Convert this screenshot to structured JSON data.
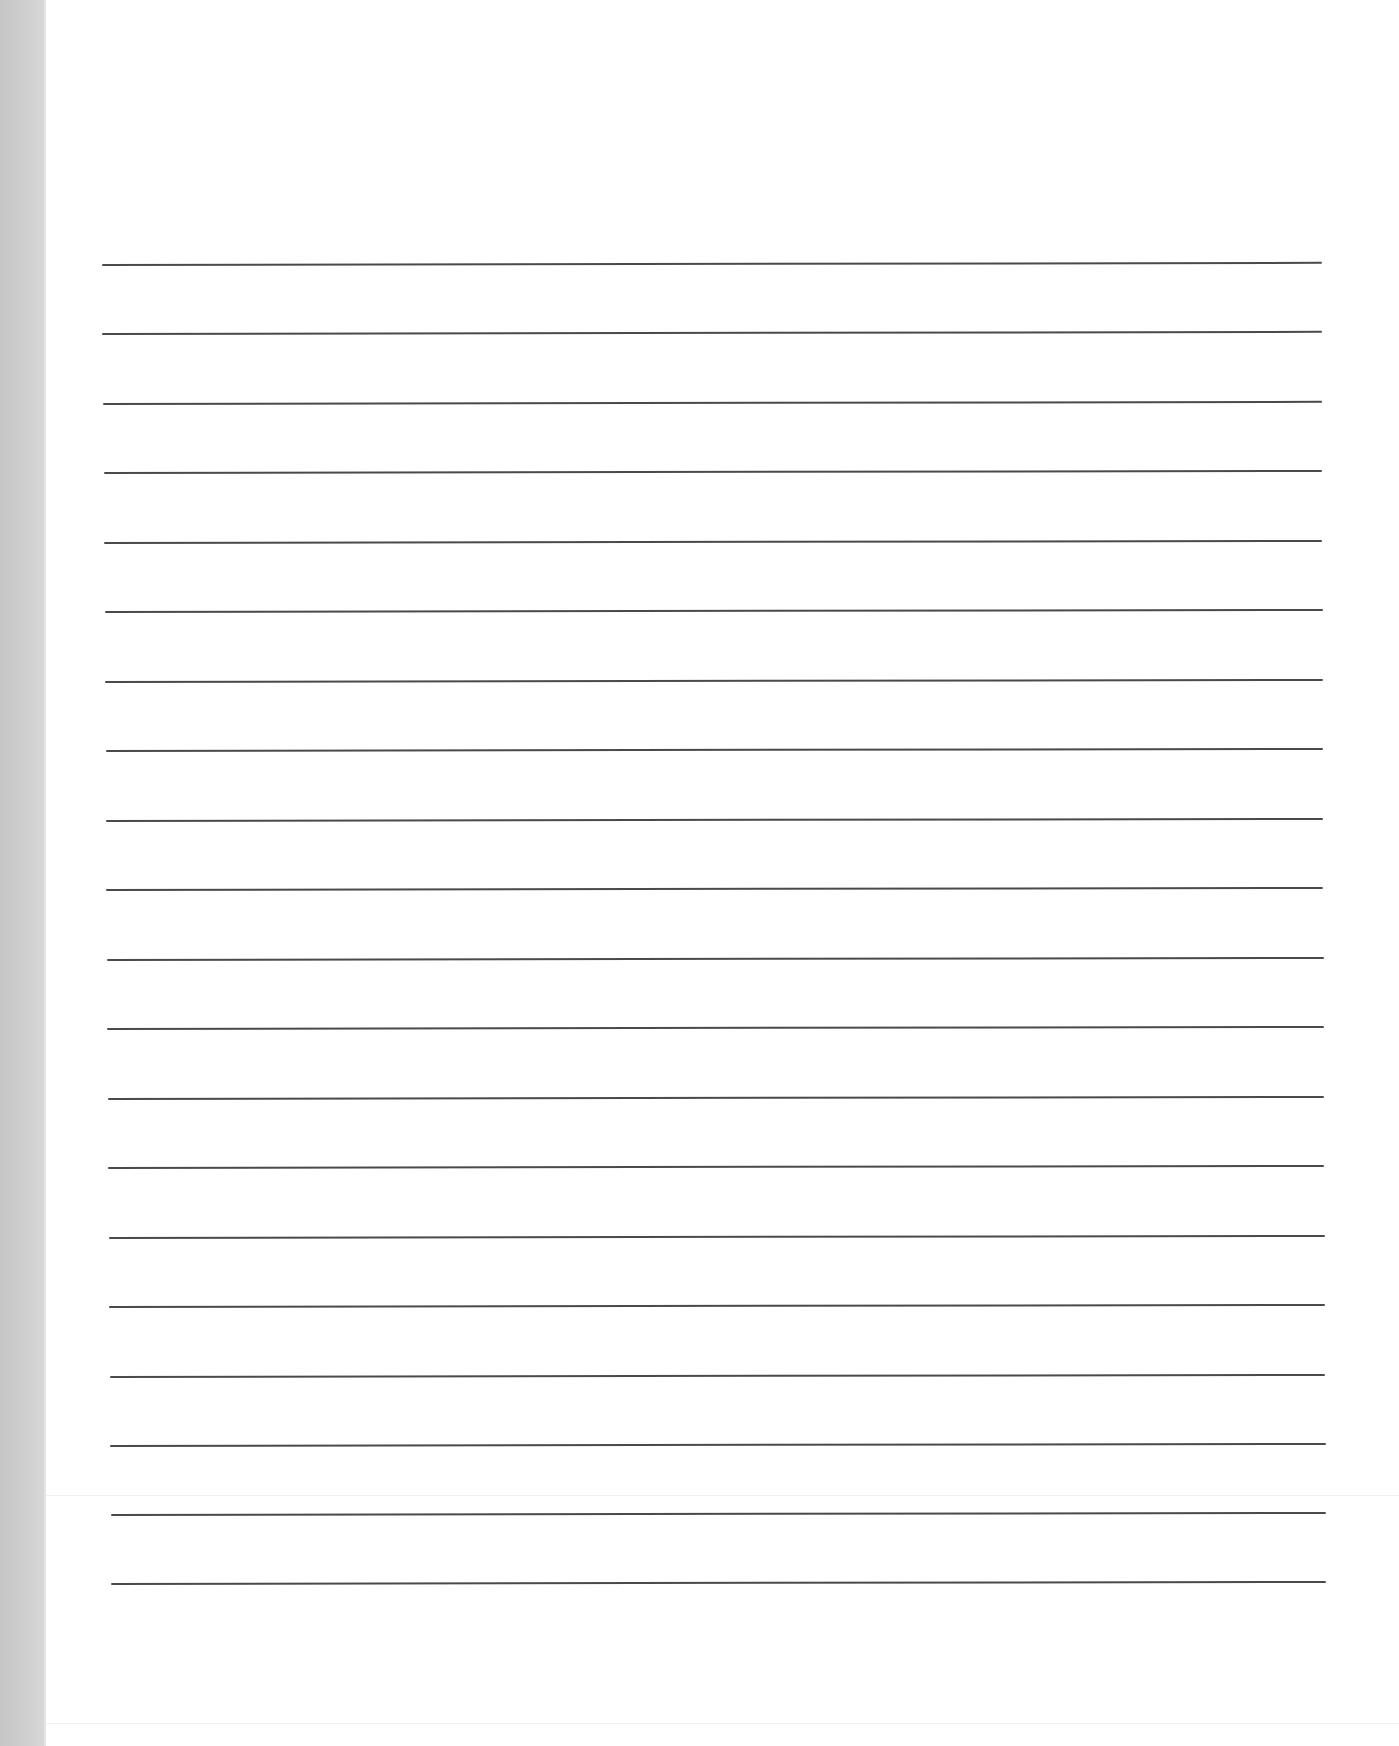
{
  "page": {
    "type": "blank lined paper (scan)",
    "background_color": "#ffffff",
    "side_strip_color": "#d0d0d0",
    "rule_color": "#4a4a4a"
  },
  "rules": [
    {
      "index": 1,
      "y": 265,
      "x1": 102,
      "x2": 1322
    },
    {
      "index": 2,
      "y": 334,
      "x1": 102,
      "x2": 1322
    },
    {
      "index": 3,
      "y": 404,
      "x1": 103,
      "x2": 1322
    },
    {
      "index": 4,
      "y": 473,
      "x1": 104,
      "x2": 1322
    },
    {
      "index": 5,
      "y": 543,
      "x1": 104,
      "x2": 1322
    },
    {
      "index": 6,
      "y": 612,
      "x1": 105,
      "x2": 1323
    },
    {
      "index": 7,
      "y": 682,
      "x1": 105,
      "x2": 1323
    },
    {
      "index": 8,
      "y": 751,
      "x1": 106,
      "x2": 1323
    },
    {
      "index": 9,
      "y": 821,
      "x1": 106,
      "x2": 1323
    },
    {
      "index": 10,
      "y": 890,
      "x1": 106,
      "x2": 1323
    },
    {
      "index": 11,
      "y": 960,
      "x1": 107,
      "x2": 1324
    },
    {
      "index": 12,
      "y": 1029,
      "x1": 107,
      "x2": 1324
    },
    {
      "index": 13,
      "y": 1099,
      "x1": 108,
      "x2": 1324
    },
    {
      "index": 14,
      "y": 1168,
      "x1": 108,
      "x2": 1324
    },
    {
      "index": 15,
      "y": 1238,
      "x1": 109,
      "x2": 1325
    },
    {
      "index": 16,
      "y": 1307,
      "x1": 109,
      "x2": 1325
    },
    {
      "index": 17,
      "y": 1377,
      "x1": 110,
      "x2": 1325
    },
    {
      "index": 18,
      "y": 1446,
      "x1": 110,
      "x2": 1326
    },
    {
      "index": 19,
      "y": 1515,
      "x1": 111,
      "x2": 1326
    },
    {
      "index": 20,
      "y": 1584,
      "x1": 111,
      "x2": 1326
    }
  ],
  "fold_lines": [
    1495,
    1723
  ]
}
